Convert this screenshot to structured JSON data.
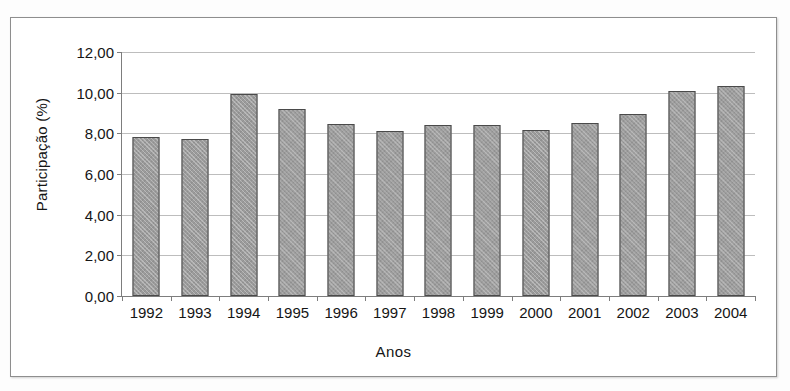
{
  "chart_data": {
    "type": "bar",
    "title": "",
    "xlabel": "Anos",
    "ylabel": "Participação (%)",
    "categories": [
      "1992",
      "1993",
      "1994",
      "1995",
      "1996",
      "1997",
      "1998",
      "1999",
      "2000",
      "2001",
      "2002",
      "2003",
      "2004"
    ],
    "values": [
      7.82,
      7.7,
      9.92,
      9.22,
      8.48,
      8.13,
      8.42,
      8.42,
      8.15,
      8.53,
      8.97,
      10.1,
      10.35
    ],
    "series": [
      {
        "name": "Participação (%)",
        "values": [
          7.82,
          7.7,
          9.92,
          9.22,
          8.48,
          8.13,
          8.42,
          8.42,
          8.15,
          8.53,
          8.97,
          10.1,
          10.35
        ]
      }
    ],
    "ylim": [
      0,
      12
    ],
    "ytick_step": 2,
    "ytick_labels": [
      "0,00",
      "2,00",
      "4,00",
      "6,00",
      "8,00",
      "10,00",
      "12,00"
    ],
    "ytick_values": [
      0,
      2,
      4,
      6,
      8,
      10,
      12
    ],
    "grid": true,
    "grid_axis": "y",
    "legend": false,
    "legend_position": "none",
    "bar_color": "#9b9b9b",
    "bar_border_color": "#4a4a4a",
    "gridline_color": "#bdbdbd",
    "axis_color": "#7d7d7d",
    "frame": true
  }
}
